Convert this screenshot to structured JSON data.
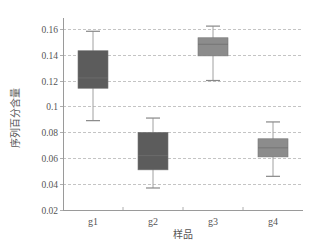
{
  "chart_data": {
    "type": "box",
    "title": "",
    "xlabel": "样品",
    "ylabel": "序列百分含量",
    "ylim": [
      0.02,
      0.165
    ],
    "yticks": [
      0.02,
      0.04,
      0.06,
      0.08,
      0.1,
      0.12,
      0.14,
      0.16
    ],
    "ytick_labels": [
      "0.02",
      "0.04",
      "0.06",
      "0.08",
      "0.1",
      "0.12",
      "0.14",
      "0.16"
    ],
    "grid": {
      "y": true,
      "x": false,
      "style": "dashed"
    },
    "legend": null,
    "categories": [
      "g1",
      "g2",
      "g3",
      "g4"
    ],
    "series": [
      {
        "name": "g1",
        "whisker_low": 0.089,
        "q1": 0.114,
        "median": 0.122,
        "q3": 0.143,
        "whisker_high": 0.158,
        "color": "#5c5c5c"
      },
      {
        "name": "g2",
        "whisker_low": 0.037,
        "q1": 0.051,
        "median": 0.062,
        "q3": 0.08,
        "whisker_high": 0.091,
        "color": "#5c5c5c"
      },
      {
        "name": "g3",
        "whisker_low": 0.12,
        "q1": 0.139,
        "median": 0.148,
        "q3": 0.153,
        "whisker_high": 0.162,
        "color": "#8c8c8c"
      },
      {
        "name": "g4",
        "whisker_low": 0.046,
        "q1": 0.061,
        "median": 0.068,
        "q3": 0.075,
        "whisker_high": 0.088,
        "color": "#8c8c8c"
      }
    ]
  },
  "colors": {
    "axis": "#9a9a9a",
    "grid": "#b5b5b5",
    "whisker": "#a0a0a0",
    "text": "#555555"
  }
}
